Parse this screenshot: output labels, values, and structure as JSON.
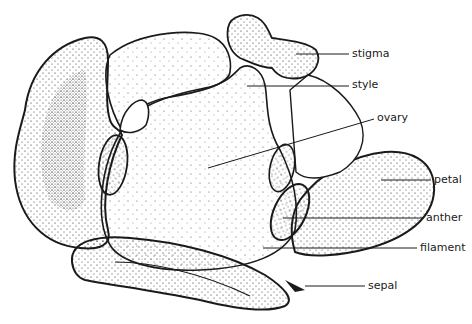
{
  "diagram": {
    "labels": [
      {
        "id": "stigma",
        "text": "stigma",
        "x": 352,
        "y": 48,
        "line": {
          "x1": 296,
          "y1": 54,
          "x2": 349,
          "y2": 54
        }
      },
      {
        "id": "style",
        "text": "style",
        "x": 352,
        "y": 79,
        "line": {
          "x1": 247,
          "y1": 86,
          "x2": 349,
          "y2": 86
        }
      },
      {
        "id": "ovary",
        "text": "ovary",
        "x": 377,
        "y": 112,
        "line": {
          "x1": 208,
          "y1": 168,
          "x2": 374,
          "y2": 119
        }
      },
      {
        "id": "petal",
        "text": "petal",
        "x": 434,
        "y": 174,
        "line": {
          "x1": 381,
          "y1": 180,
          "x2": 431,
          "y2": 180
        }
      },
      {
        "id": "anther",
        "text": "anther",
        "x": 426,
        "y": 212,
        "line": {
          "x1": 283,
          "y1": 218,
          "x2": 423,
          "y2": 218
        }
      },
      {
        "id": "filament",
        "text": "filament",
        "x": 420,
        "y": 242,
        "line": {
          "x1": 263,
          "y1": 248,
          "x2": 417,
          "y2": 248
        }
      },
      {
        "id": "sepal",
        "text": "sepal",
        "x": 368,
        "y": 280,
        "line": {
          "x1": 305,
          "y1": 286,
          "x2": 365,
          "y2": 286
        }
      }
    ],
    "colors": {
      "ink": "#1a1a1a",
      "background": "#ffffff"
    }
  }
}
